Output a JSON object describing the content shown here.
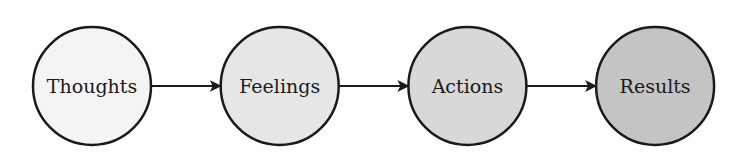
{
  "diagram": {
    "type": "flow",
    "nodes": [
      {
        "id": "thoughts",
        "label": "Thoughts",
        "fill": "#f4f4f4"
      },
      {
        "id": "feelings",
        "label": "Feelings",
        "fill": "#e6e6e6"
      },
      {
        "id": "actions",
        "label": "Actions",
        "fill": "#d8d8d8"
      },
      {
        "id": "results",
        "label": "Results",
        "fill": "#c4c4c4"
      }
    ],
    "edges": [
      {
        "from": "thoughts",
        "to": "feelings"
      },
      {
        "from": "feelings",
        "to": "actions"
      },
      {
        "from": "actions",
        "to": "results"
      }
    ],
    "stroke_color": "#1a1a1a"
  }
}
